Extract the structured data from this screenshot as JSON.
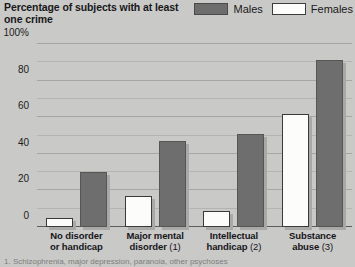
{
  "title": "Percentage of subjects with at least one crime",
  "legend": {
    "position": "top-right",
    "entries": [
      {
        "label": "Males",
        "color": "#6e6e6e",
        "swatch": "males-swatch"
      },
      {
        "label": "Females",
        "color": "#fcfcfa",
        "swatch": "females-swatch"
      }
    ]
  },
  "footnote": "1. Schizophrenia, major depression, paranoia, other psychoses",
  "chart_data": {
    "type": "bar",
    "title": "Percentage of subjects with at least one crime",
    "xlabel": "",
    "ylabel": "",
    "ylim": [
      0,
      100
    ],
    "yticks": [
      0,
      20,
      40,
      60,
      80,
      100
    ],
    "ytick_labels": [
      "0",
      "20",
      "40",
      "60",
      "80",
      "100%"
    ],
    "minor_tick_step": 10,
    "grid": true,
    "legend_position": "top-right",
    "categories": [
      "No disorder or handicap",
      "Major mental disorder (1)",
      "Intellectual handicap (2)",
      "Substance abuse (3)"
    ],
    "category_lines": [
      {
        "line1": "No disorder",
        "line2": "or handicap",
        "note": ""
      },
      {
        "line1": "Major mental",
        "line2": "disorder",
        "note": " (1)"
      },
      {
        "line1": "Intellectual",
        "line2": "handicap",
        "note": " (2)"
      },
      {
        "line1": "Substance",
        "line2": "abuse",
        "note": " (3)"
      }
    ],
    "series": [
      {
        "name": "Females",
        "values": [
          5,
          17,
          9,
          62
        ]
      },
      {
        "name": "Males",
        "values": [
          30,
          47,
          51,
          91
        ]
      }
    ]
  }
}
